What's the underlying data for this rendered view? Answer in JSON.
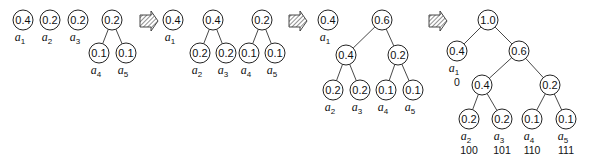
{
  "diagram": {
    "colors": {
      "stroke": "#222222",
      "text": "#111111",
      "hatch": "#555555",
      "background": "#ffffff"
    },
    "stages": [
      {
        "id": "stage1",
        "nodes": [
          {
            "id": "s1_a1",
            "value": "0.4",
            "x": 23,
            "y": 20,
            "label": "a",
            "sub": "1"
          },
          {
            "id": "s1_a2",
            "value": "0.2",
            "x": 50,
            "y": 20,
            "label": "a",
            "sub": "2"
          },
          {
            "id": "s1_a3",
            "value": "0.2",
            "x": 78,
            "y": 20,
            "label": "a",
            "sub": "3"
          },
          {
            "id": "s1_p45",
            "value": "0.2",
            "x": 112,
            "y": 20
          },
          {
            "id": "s1_a4",
            "value": "0.1",
            "x": 99,
            "y": 53,
            "label": "a",
            "sub": "4",
            "parent": "s1_p45"
          },
          {
            "id": "s1_a5",
            "value": "0.1",
            "x": 126,
            "y": 53,
            "label": "a",
            "sub": "5",
            "parent": "s1_p45"
          }
        ]
      },
      {
        "id": "stage2",
        "nodes": [
          {
            "id": "s2_a1",
            "value": "0.4",
            "x": 173,
            "y": 20,
            "label": "a",
            "sub": "1"
          },
          {
            "id": "s2_p23",
            "value": "0.4",
            "x": 213,
            "y": 20
          },
          {
            "id": "s2_a2",
            "value": "0.2",
            "x": 200,
            "y": 53,
            "label": "a",
            "sub": "2",
            "parent": "s2_p23"
          },
          {
            "id": "s2_a3",
            "value": "0.2",
            "x": 226,
            "y": 53,
            "label": "a",
            "sub": "3",
            "parent": "s2_p23"
          },
          {
            "id": "s2_p45",
            "value": "0.2",
            "x": 262,
            "y": 20
          },
          {
            "id": "s2_a4",
            "value": "0.1",
            "x": 249,
            "y": 53,
            "label": "a",
            "sub": "4",
            "parent": "s2_p45"
          },
          {
            "id": "s2_a5",
            "value": "0.1",
            "x": 275,
            "y": 53,
            "label": "a",
            "sub": "5",
            "parent": "s2_p45"
          }
        ]
      },
      {
        "id": "stage3",
        "nodes": [
          {
            "id": "s3_a1",
            "value": "0.4",
            "x": 328,
            "y": 20,
            "label": "a",
            "sub": "1"
          },
          {
            "id": "s3_root",
            "value": "0.6",
            "x": 382,
            "y": 20
          },
          {
            "id": "s3_p23",
            "value": "0.4",
            "x": 346,
            "y": 55,
            "parent": "s3_root"
          },
          {
            "id": "s3_p45",
            "value": "0.2",
            "x": 398,
            "y": 55,
            "parent": "s3_root"
          },
          {
            "id": "s3_a2",
            "value": "0.2",
            "x": 333,
            "y": 90,
            "label": "a",
            "sub": "2",
            "parent": "s3_p23"
          },
          {
            "id": "s3_a3",
            "value": "0.2",
            "x": 360,
            "y": 90,
            "label": "a",
            "sub": "3",
            "parent": "s3_p23"
          },
          {
            "id": "s3_a4",
            "value": "0.1",
            "x": 386,
            "y": 90,
            "label": "a",
            "sub": "4",
            "parent": "s3_p45"
          },
          {
            "id": "s3_a5",
            "value": "0.1",
            "x": 413,
            "y": 90,
            "label": "a",
            "sub": "5",
            "parent": "s3_p45"
          }
        ]
      },
      {
        "id": "stage4",
        "nodes": [
          {
            "id": "s4_root",
            "value": "1.0",
            "x": 488,
            "y": 20
          },
          {
            "id": "s4_a1",
            "value": "0.4",
            "x": 457,
            "y": 51,
            "label": "a",
            "sub": "1",
            "code": "0",
            "parent": "s4_root"
          },
          {
            "id": "s4_p6",
            "value": "0.6",
            "x": 519,
            "y": 51,
            "parent": "s4_root"
          },
          {
            "id": "s4_p23",
            "value": "0.4",
            "x": 482,
            "y": 85,
            "parent": "s4_p6"
          },
          {
            "id": "s4_p45",
            "value": "0.2",
            "x": 550,
            "y": 85,
            "parent": "s4_p6"
          },
          {
            "id": "s4_a2",
            "value": "0.2",
            "x": 469,
            "y": 119,
            "label": "a",
            "sub": "2",
            "code": "100",
            "parent": "s4_p23"
          },
          {
            "id": "s4_a3",
            "value": "0.2",
            "x": 502,
            "y": 119,
            "label": "a",
            "sub": "3",
            "code": "101",
            "parent": "s4_p23"
          },
          {
            "id": "s4_a4",
            "value": "0.1",
            "x": 532,
            "y": 119,
            "label": "a",
            "sub": "4",
            "code": "110",
            "parent": "s4_p45"
          },
          {
            "id": "s4_a5",
            "value": "0.1",
            "x": 566,
            "y": 119,
            "label": "a",
            "sub": "5",
            "code": "111",
            "parent": "s4_p45"
          }
        ]
      }
    ],
    "arrows": [
      {
        "id": "arrow1",
        "icon": "hatched-right-arrow-icon",
        "x": 140,
        "y": 21
      },
      {
        "id": "arrow2",
        "icon": "hatched-right-arrow-icon",
        "x": 289,
        "y": 21
      },
      {
        "id": "arrow3",
        "icon": "hatched-right-arrow-icon",
        "x": 429,
        "y": 21
      }
    ],
    "node_radius": 10
  }
}
